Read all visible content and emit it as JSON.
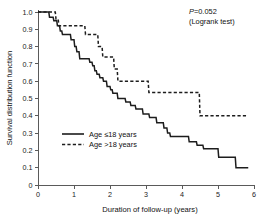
{
  "figure": {
    "background_color": "#ffffff",
    "line_color": "#1d1d1d",
    "axis_color": "#5a5a5a"
  },
  "annotation": {
    "p_value_prefix": "P",
    "p_value_text": "P=0.052",
    "test_text": "(Logrank test)"
  },
  "legend": {
    "entries": [
      {
        "label": "Age ≤18 years",
        "style": "solid"
      },
      {
        "label": "Age >18 years",
        "style": "dashed"
      }
    ]
  },
  "chart_data": {
    "type": "line",
    "subtype": "kaplan-meier-step",
    "title": "",
    "xlabel": "Duration of follow-up (years)",
    "ylabel": "Survival distribution function",
    "xlim": [
      0,
      6
    ],
    "ylim": [
      0,
      1.0
    ],
    "grid": false,
    "legend_position": "center-left",
    "xticks": [
      0,
      1,
      2,
      3,
      4,
      5,
      6
    ],
    "xticklabels": [
      "0",
      "1",
      "2",
      "3",
      "4",
      "5",
      "6"
    ],
    "yticks": [
      0,
      0.1,
      0.2,
      0.3,
      0.4,
      0.5,
      0.6,
      0.7,
      0.8,
      0.9,
      1.0
    ],
    "yticklabels": [
      "0",
      "0.1",
      "0.2",
      "0.3",
      "0.4",
      "0.5",
      "0.6",
      "0.7",
      "0.8",
      "0.9",
      "1.0"
    ],
    "annotations": [
      "P=0.052",
      "(Logrank test)"
    ],
    "series": [
      {
        "name": "Age ≤18 years",
        "style": "solid",
        "points": [
          [
            0.0,
            1.0
          ],
          [
            0.3,
            1.0
          ],
          [
            0.32,
            0.97
          ],
          [
            0.42,
            0.97
          ],
          [
            0.44,
            0.95
          ],
          [
            0.52,
            0.95
          ],
          [
            0.54,
            0.92
          ],
          [
            0.6,
            0.92
          ],
          [
            0.62,
            0.89
          ],
          [
            0.66,
            0.89
          ],
          [
            0.68,
            0.87
          ],
          [
            0.9,
            0.87
          ],
          [
            0.92,
            0.84
          ],
          [
            1.0,
            0.84
          ],
          [
            1.02,
            0.8
          ],
          [
            1.06,
            0.8
          ],
          [
            1.08,
            0.77
          ],
          [
            1.14,
            0.77
          ],
          [
            1.16,
            0.73
          ],
          [
            1.42,
            0.73
          ],
          [
            1.44,
            0.71
          ],
          [
            1.5,
            0.71
          ],
          [
            1.52,
            0.69
          ],
          [
            1.56,
            0.69
          ],
          [
            1.58,
            0.66
          ],
          [
            1.62,
            0.66
          ],
          [
            1.64,
            0.64
          ],
          [
            1.7,
            0.64
          ],
          [
            1.72,
            0.62
          ],
          [
            1.8,
            0.62
          ],
          [
            1.82,
            0.6
          ],
          [
            1.9,
            0.6
          ],
          [
            1.92,
            0.57
          ],
          [
            2.0,
            0.57
          ],
          [
            2.02,
            0.55
          ],
          [
            2.06,
            0.55
          ],
          [
            2.08,
            0.53
          ],
          [
            2.2,
            0.53
          ],
          [
            2.22,
            0.5
          ],
          [
            2.42,
            0.5
          ],
          [
            2.44,
            0.48
          ],
          [
            2.56,
            0.48
          ],
          [
            2.58,
            0.46
          ],
          [
            2.7,
            0.46
          ],
          [
            2.72,
            0.44
          ],
          [
            2.9,
            0.44
          ],
          [
            2.92,
            0.41
          ],
          [
            3.08,
            0.41
          ],
          [
            3.1,
            0.39
          ],
          [
            3.28,
            0.39
          ],
          [
            3.3,
            0.36
          ],
          [
            3.48,
            0.36
          ],
          [
            3.5,
            0.33
          ],
          [
            3.58,
            0.33
          ],
          [
            3.6,
            0.3
          ],
          [
            3.66,
            0.3
          ],
          [
            3.68,
            0.28
          ],
          [
            4.18,
            0.28
          ],
          [
            4.2,
            0.25
          ],
          [
            4.4,
            0.25
          ],
          [
            4.42,
            0.23
          ],
          [
            4.58,
            0.23
          ],
          [
            4.6,
            0.21
          ],
          [
            5.0,
            0.21
          ],
          [
            5.02,
            0.16
          ],
          [
            5.48,
            0.16
          ],
          [
            5.5,
            0.1
          ],
          [
            5.84,
            0.1
          ]
        ]
      },
      {
        "name": "Age >18 years",
        "style": "dashed",
        "points": [
          [
            0.0,
            1.0
          ],
          [
            0.48,
            1.0
          ],
          [
            0.5,
            0.96
          ],
          [
            0.56,
            0.96
          ],
          [
            0.58,
            0.92
          ],
          [
            1.3,
            0.92
          ],
          [
            1.32,
            0.87
          ],
          [
            1.42,
            0.87
          ],
          [
            1.44,
            0.87
          ],
          [
            1.66,
            0.87
          ],
          [
            1.68,
            0.8
          ],
          [
            1.78,
            0.8
          ],
          [
            1.8,
            0.74
          ],
          [
            2.1,
            0.74
          ],
          [
            2.12,
            0.67
          ],
          [
            2.2,
            0.67
          ],
          [
            2.22,
            0.6
          ],
          [
            3.06,
            0.6
          ],
          [
            3.08,
            0.535
          ],
          [
            4.48,
            0.535
          ],
          [
            4.5,
            0.4
          ],
          [
            5.84,
            0.4
          ]
        ]
      }
    ]
  }
}
